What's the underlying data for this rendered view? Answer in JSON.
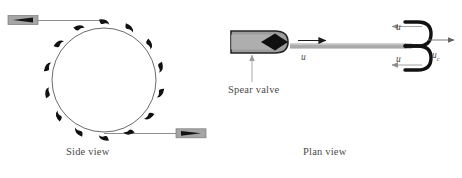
{
  "figure": {
    "background": "#ffffff",
    "width": 462,
    "height": 178
  },
  "colors": {
    "ink": "#4a4a4a",
    "line": "#555555",
    "bucket_fill": "#111111",
    "nozzle_body": "#9a9a9a",
    "nozzle_outline": "#2b2b2b",
    "spear_cone": "#121212",
    "jet_fill": "#a8a8a8",
    "arrow": "#6b6b6b",
    "leader": "#9b9b9b"
  },
  "captions": {
    "side_view": "Side view",
    "plan_view": "Plan view",
    "spear_valve": "Spear valve"
  },
  "labels": {
    "jet_velocity": "u",
    "bucket_exit_top": "u",
    "bucket_exit_bottom": "u",
    "runner_velocity": "u",
    "runner_velocity_subscript": "c"
  },
  "side_view": {
    "wheel": {
      "cx": 104,
      "cy": 80,
      "r": 52
    },
    "bucket_count": 14,
    "bucket_start_angle_deg": -90,
    "nozzles": [
      {
        "name": "upper-left-nozzle",
        "direction": "right",
        "body_x": 8,
        "body_y": 16,
        "body_w": 30,
        "body_h": 9,
        "pipe_to_x": 104,
        "pipe_y": 20
      },
      {
        "name": "lower-right-nozzle",
        "direction": "left",
        "body_x": 172,
        "body_y": 130,
        "body_w": 30,
        "body_h": 9,
        "pipe_to_x": 104,
        "pipe_y": 134
      }
    ]
  },
  "plan_view": {
    "nozzle": {
      "x": 231,
      "y": 31,
      "w": 56,
      "h": 22,
      "tip_x": 296
    },
    "jet": {
      "x0": 296,
      "x1": 412,
      "y": 46,
      "thickness": 5
    },
    "bucket": {
      "x": 405,
      "y_top": 22,
      "y_bottom": 70,
      "lobe_depth": 20
    },
    "arrows": [
      {
        "name": "jet-arrow",
        "from": [
          299,
          46
        ],
        "to": [
          325,
          46
        ],
        "dir": "right"
      },
      {
        "name": "exit-arrow-top",
        "from": [
          420,
          27
        ],
        "to": [
          390,
          27
        ],
        "dir": "left"
      },
      {
        "name": "exit-arrow-bottom",
        "from": [
          420,
          65
        ],
        "to": [
          390,
          65
        ],
        "dir": "left"
      },
      {
        "name": "runner-arrow",
        "from": [
          428,
          40
        ],
        "to": [
          452,
          40
        ],
        "dir": "right"
      }
    ],
    "leader": {
      "from": [
        252,
        80
      ],
      "to": [
        252,
        52
      ]
    }
  }
}
